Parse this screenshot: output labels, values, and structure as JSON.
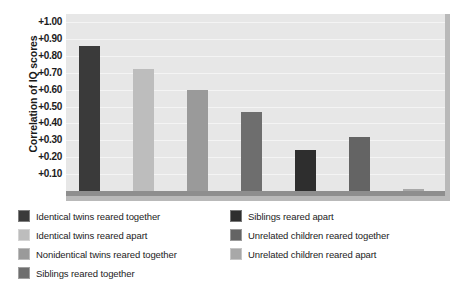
{
  "chart_data": {
    "type": "bar",
    "title": "",
    "xlabel": "",
    "ylabel": "Correlation of IQ scores",
    "ylim": [
      0,
      1.0
    ],
    "grid": true,
    "legend_position": "bottom",
    "y_ticks": [
      "+1.00",
      "+0.90",
      "+0.80",
      "+0.70",
      "+0.60",
      "+0.50",
      "+0.40",
      "+0.30",
      "+0.20",
      "+0.10"
    ],
    "y_tick_values": [
      1.0,
      0.9,
      0.8,
      0.7,
      0.6,
      0.5,
      0.4,
      0.3,
      0.2,
      0.1
    ],
    "categories": [
      "Identical twins reared together",
      "Identical twins reared apart",
      "Nonidentical twins reared together",
      "Siblings reared together",
      "Siblings reared apart",
      "Unrelated children reared together",
      "Unrelated children reared apart"
    ],
    "values": [
      0.86,
      0.72,
      0.6,
      0.47,
      0.24,
      0.32,
      0.01
    ],
    "colors": [
      "#3a3a3a",
      "#bdbdbd",
      "#9a9a9a",
      "#6e6e6e",
      "#2e2e2e",
      "#646464",
      "#a8a8a8"
    ]
  },
  "legend": {
    "left_column": [
      {
        "label": "Identical twins reared together",
        "color": "#3a3a3a"
      },
      {
        "label": "Identical twins reared apart",
        "color": "#bdbdbd"
      },
      {
        "label": "Nonidentical twins reared together",
        "color": "#9a9a9a"
      },
      {
        "label": "Siblings reared together",
        "color": "#6e6e6e"
      }
    ],
    "right_column": [
      {
        "label": "Siblings reared apart",
        "color": "#2e2e2e"
      },
      {
        "label": "Unrelated children reared together",
        "color": "#646464"
      },
      {
        "label": "Unrelated children reared apart",
        "color": "#a8a8a8"
      }
    ]
  }
}
